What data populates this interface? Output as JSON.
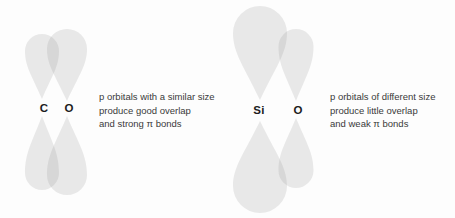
{
  "colors": {
    "background": "#fdfdfd",
    "lobe_fill": "#8f8f8f",
    "lobe_opacity": 0.19,
    "atom_label": "#1c1c1c",
    "caption_text": "#3a3a3a"
  },
  "figure": {
    "atoms": [
      {
        "symbol": "C",
        "x": 44,
        "y": 108
      },
      {
        "symbol": "O",
        "x": 69,
        "y": 108
      },
      {
        "symbol": "Si",
        "x": 259,
        "y": 110
      },
      {
        "symbol": "O",
        "x": 298,
        "y": 110
      }
    ],
    "orbitals": [
      {
        "atom": "C",
        "cx": 42,
        "w": 34,
        "top": {
          "tip": 99,
          "h": 65
        },
        "bottom": {
          "tip": 116,
          "h": 74
        }
      },
      {
        "atom": "O-left",
        "cx": 67,
        "w": 40,
        "top": {
          "tip": 101,
          "h": 72
        },
        "bottom": {
          "tip": 116,
          "h": 79
        }
      },
      {
        "atom": "Si",
        "cx": 260,
        "w": 54,
        "top": {
          "tip": 100,
          "h": 94
        },
        "bottom": {
          "tip": 121,
          "h": 92
        }
      },
      {
        "atom": "O-right",
        "cx": 296,
        "w": 35,
        "top": {
          "tip": 101,
          "h": 72
        },
        "bottom": {
          "tip": 118,
          "h": 70
        }
      }
    ]
  },
  "captions": {
    "co": {
      "lines": [
        "p orbitals with a similar size",
        "produce good overlap",
        "and strong π bonds"
      ]
    },
    "sio": {
      "lines": [
        "p orbitals of different size",
        "produce little overlap",
        "and weak π bonds"
      ]
    }
  }
}
